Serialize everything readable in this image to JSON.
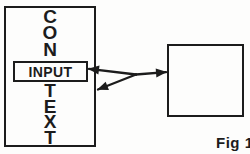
{
  "diagram": {
    "context_word_top": "CON",
    "context_word_bottom": "TEXT",
    "input_label": "INPUT",
    "fig_label": "Fig 1",
    "colors": {
      "ink": "#1c1c1c",
      "paper": "#fdfdfc"
    }
  }
}
